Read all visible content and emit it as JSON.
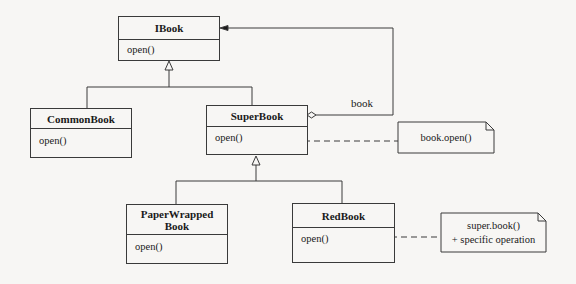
{
  "diagram": {
    "type": "UML class diagram",
    "classes": [
      {
        "id": "ibook",
        "name": "IBook",
        "operations": [
          "open()"
        ]
      },
      {
        "id": "commonbook",
        "name": "CommonBook",
        "operations": [
          "open()"
        ]
      },
      {
        "id": "superbook",
        "name": "SuperBook",
        "operations": [
          "open()"
        ]
      },
      {
        "id": "paperwrapped",
        "name_line1": "PaperWrapped",
        "name_line2": "Book",
        "operations": [
          "open()"
        ]
      },
      {
        "id": "redbook",
        "name": "RedBook",
        "operations": [
          "open()"
        ]
      }
    ],
    "notes": [
      {
        "id": "note-superbook",
        "lines": [
          "book.open()"
        ]
      },
      {
        "id": "note-redbook",
        "lines": [
          "super.book()",
          "+ specific operation"
        ]
      }
    ],
    "associations": [
      {
        "from": "SuperBook",
        "to": "IBook",
        "kind": "aggregation",
        "role": "book"
      }
    ],
    "generalizations": [
      {
        "child": "CommonBook",
        "parent": "IBook"
      },
      {
        "child": "SuperBook",
        "parent": "IBook"
      },
      {
        "child": "PaperWrappedBook",
        "parent": "SuperBook"
      },
      {
        "child": "RedBook",
        "parent": "SuperBook"
      }
    ],
    "colors": {
      "line": "#3a3a3a",
      "background": "#f7f6f4"
    }
  }
}
